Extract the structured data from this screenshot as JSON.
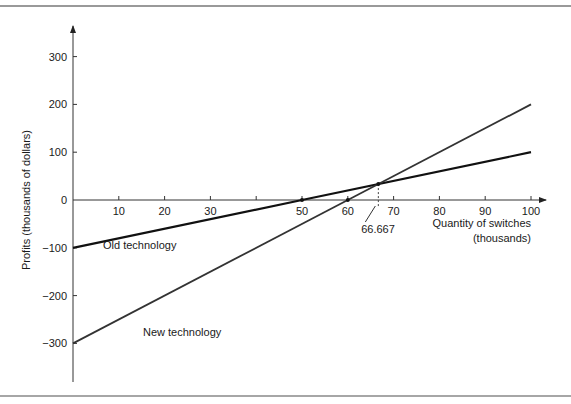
{
  "chart_data": {
    "type": "line",
    "title": "",
    "xlabel": "Quantity of switches (thousands)",
    "xlabel_lines": [
      "Quantity of switches",
      "(thousands)"
    ],
    "ylabel": "Profits (thousands of dollars)",
    "xlim": [
      0,
      100
    ],
    "ylim": [
      -380,
      330
    ],
    "x_ticks": [
      10,
      20,
      30,
      40,
      50,
      60,
      70,
      80,
      90,
      100
    ],
    "x_tick_labels": [
      "10",
      "20",
      "30",
      "",
      "50",
      "60",
      "70",
      "80",
      "90",
      "100"
    ],
    "y_ticks": [
      300,
      200,
      100,
      0,
      -100,
      -200,
      -300
    ],
    "y_tick_labels": [
      "300",
      "200",
      "100",
      "0",
      "−100",
      "−200",
      "−300"
    ],
    "grid": false,
    "series": [
      {
        "name": "Old technology",
        "x": [
          0,
          50,
          100
        ],
        "values": [
          -100,
          0,
          100
        ],
        "color": "#111111",
        "width": 2.2
      },
      {
        "name": "New technology",
        "x": [
          0,
          60,
          100
        ],
        "values": [
          -300,
          0,
          200
        ],
        "color": "#333333",
        "width": 1.8
      }
    ],
    "annotations": [
      {
        "text": "Old technology",
        "x": 9,
        "y": -120
      },
      {
        "text": "New technology",
        "x": 20,
        "y": -270
      },
      {
        "text": "66.667",
        "x": 66.667,
        "y": 33.33,
        "note": "intersection (break-even) point"
      }
    ],
    "marked_points": [
      {
        "x": 50,
        "y": 0
      },
      {
        "x": 60,
        "y": 0
      },
      {
        "x": 66.667,
        "y": 33.33
      }
    ]
  }
}
